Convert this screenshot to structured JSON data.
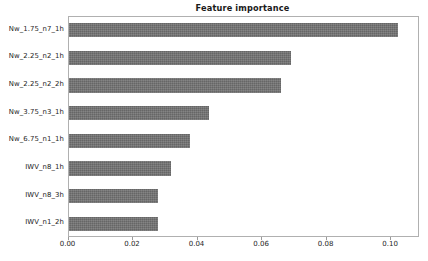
{
  "chart_data": {
    "type": "bar",
    "orientation": "horizontal",
    "title": "Feature importance",
    "xlabel": "",
    "ylabel": "",
    "categories": [
      "Nw_1.75_n7_1h",
      "Nw_2.25_n2_1h",
      "Nw_2.25_n2_2h",
      "Nw_3.75_n3_1h",
      "Nw_6.75_n1_1h",
      "IWV_n8_1h",
      "IWV_n8_3h",
      "IWV_n1_2h"
    ],
    "values": [
      0.102,
      0.069,
      0.066,
      0.0435,
      0.0376,
      0.0318,
      0.0278,
      0.0277
    ],
    "xlim": [
      0.0,
      0.1088
    ],
    "ylim": [
      0,
      8
    ],
    "xticks": [
      0.0,
      0.02,
      0.04,
      0.06,
      0.08,
      0.1
    ],
    "xticklabels": [
      "0.00",
      "0.02",
      "0.04",
      "0.06",
      "0.08",
      "0.10"
    ],
    "grid": false,
    "legend": null,
    "bar_color": "#707070",
    "frame_color": "#b0b0b0",
    "text_color": "#262626"
  }
}
